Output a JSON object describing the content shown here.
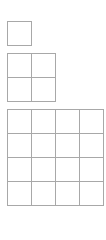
{
  "diagram": {
    "line_color": "#a8a8a8",
    "background": "#ffffff",
    "cell_size_px": 24,
    "grids": [
      {
        "name": "grid-1x1",
        "rows": 1,
        "cols": 1,
        "left": 7,
        "top": 21
      },
      {
        "name": "grid-2x2",
        "rows": 2,
        "cols": 2,
        "left": 7,
        "top": 53
      },
      {
        "name": "grid-4x4",
        "rows": 4,
        "cols": 4,
        "left": 7,
        "top": 109
      }
    ]
  }
}
